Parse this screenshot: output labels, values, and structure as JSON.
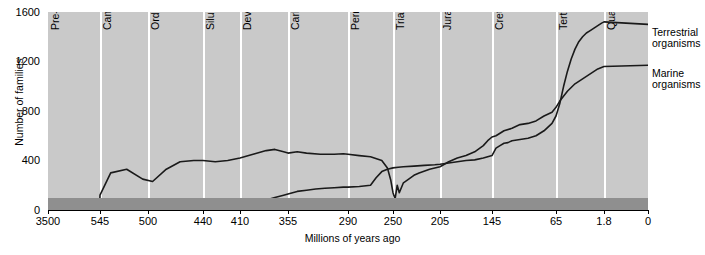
{
  "chart_data": {
    "type": "line",
    "title": "",
    "xlabel": "Millions of years ago",
    "ylabel": "Number of families",
    "ylim": [
      0,
      1600
    ],
    "yticks": [
      0,
      400,
      800,
      1200,
      1600
    ],
    "xlim": [
      3500,
      0
    ],
    "xticks": [
      "3500",
      "545",
      "500",
      "440",
      "410",
      "355",
      "290",
      "250",
      "205",
      "145",
      "65",
      "1.8",
      "0"
    ],
    "grid": false,
    "legend_position": "right-inline",
    "geologic_periods": [
      {
        "label": "Pre-cambrian",
        "start": 3500,
        "end": 545
      },
      {
        "label": "Cambrian",
        "start": 545,
        "end": 500
      },
      {
        "label": "Ordovician",
        "start": 500,
        "end": 440
      },
      {
        "label": "Silurian",
        "start": 440,
        "end": 410
      },
      {
        "label": "Devonian",
        "start": 410,
        "end": 355
      },
      {
        "label": "Carboniferous",
        "start": 355,
        "end": 290
      },
      {
        "label": "Permian",
        "start": 290,
        "end": 250
      },
      {
        "label": "Triassic",
        "start": 250,
        "end": 205
      },
      {
        "label": "Jurassic",
        "start": 205,
        "end": 145
      },
      {
        "label": "Cretaceous",
        "start": 145,
        "end": 65
      },
      {
        "label": "Tertiary",
        "start": 65,
        "end": 1.8
      },
      {
        "label": "Quaternary",
        "start": 1.8,
        "end": 0
      }
    ],
    "series": [
      {
        "name": "Marine organisms",
        "annotation": "Marine\norganisms",
        "points": [
          [
            3500,
            0
          ],
          [
            700,
            0
          ],
          [
            620,
            20
          ],
          [
            560,
            40
          ],
          [
            545,
            120
          ],
          [
            535,
            300
          ],
          [
            520,
            330
          ],
          [
            505,
            250
          ],
          [
            495,
            230
          ],
          [
            480,
            330
          ],
          [
            465,
            390
          ],
          [
            450,
            400
          ],
          [
            440,
            400
          ],
          [
            430,
            390
          ],
          [
            420,
            400
          ],
          [
            410,
            420
          ],
          [
            400,
            440
          ],
          [
            390,
            460
          ],
          [
            380,
            480
          ],
          [
            370,
            490
          ],
          [
            360,
            470
          ],
          [
            355,
            460
          ],
          [
            345,
            470
          ],
          [
            335,
            460
          ],
          [
            320,
            450
          ],
          [
            305,
            450
          ],
          [
            295,
            455
          ],
          [
            290,
            450
          ],
          [
            280,
            440
          ],
          [
            270,
            430
          ],
          [
            260,
            400
          ],
          [
            255,
            340
          ],
          [
            252,
            240
          ],
          [
            250,
            140
          ],
          [
            248,
            90
          ],
          [
            246,
            200
          ],
          [
            244,
            140
          ],
          [
            240,
            220
          ],
          [
            235,
            250
          ],
          [
            230,
            280
          ],
          [
            225,
            300
          ],
          [
            215,
            330
          ],
          [
            205,
            350
          ],
          [
            195,
            390
          ],
          [
            185,
            420
          ],
          [
            175,
            440
          ],
          [
            165,
            470
          ],
          [
            155,
            520
          ],
          [
            150,
            560
          ],
          [
            145,
            590
          ],
          [
            140,
            600
          ],
          [
            130,
            640
          ],
          [
            120,
            660
          ],
          [
            110,
            690
          ],
          [
            100,
            700
          ],
          [
            90,
            720
          ],
          [
            80,
            760
          ],
          [
            70,
            790
          ],
          [
            65,
            830
          ],
          [
            60,
            880
          ],
          [
            50,
            960
          ],
          [
            40,
            1020
          ],
          [
            30,
            1060
          ],
          [
            20,
            1100
          ],
          [
            10,
            1140
          ],
          [
            1.8,
            1160
          ],
          [
            0,
            1170
          ]
        ]
      },
      {
        "name": "Terrestrial organisms",
        "annotation": "Terrestrial\norganisms",
        "points": [
          [
            455,
            0
          ],
          [
            440,
            10
          ],
          [
            430,
            20
          ],
          [
            420,
            30
          ],
          [
            410,
            40
          ],
          [
            400,
            50
          ],
          [
            390,
            60
          ],
          [
            380,
            80
          ],
          [
            370,
            100
          ],
          [
            360,
            120
          ],
          [
            355,
            130
          ],
          [
            345,
            150
          ],
          [
            335,
            160
          ],
          [
            325,
            170
          ],
          [
            315,
            175
          ],
          [
            305,
            180
          ],
          [
            295,
            185
          ],
          [
            290,
            185
          ],
          [
            280,
            190
          ],
          [
            270,
            200
          ],
          [
            265,
            260
          ],
          [
            260,
            310
          ],
          [
            255,
            330
          ],
          [
            250,
            340
          ],
          [
            245,
            345
          ],
          [
            240,
            350
          ],
          [
            230,
            355
          ],
          [
            220,
            360
          ],
          [
            210,
            365
          ],
          [
            205,
            370
          ],
          [
            195,
            380
          ],
          [
            185,
            390
          ],
          [
            175,
            400
          ],
          [
            165,
            405
          ],
          [
            155,
            420
          ],
          [
            150,
            430
          ],
          [
            145,
            440
          ],
          [
            140,
            500
          ],
          [
            135,
            520
          ],
          [
            130,
            540
          ],
          [
            125,
            545
          ],
          [
            120,
            560
          ],
          [
            110,
            570
          ],
          [
            100,
            580
          ],
          [
            90,
            600
          ],
          [
            80,
            640
          ],
          [
            70,
            700
          ],
          [
            65,
            760
          ],
          [
            60,
            860
          ],
          [
            55,
            1000
          ],
          [
            50,
            1120
          ],
          [
            45,
            1220
          ],
          [
            40,
            1300
          ],
          [
            35,
            1360
          ],
          [
            30,
            1400
          ],
          [
            25,
            1430
          ],
          [
            20,
            1450
          ],
          [
            15,
            1470
          ],
          [
            10,
            1490
          ],
          [
            5,
            1510
          ],
          [
            1.8,
            1520
          ],
          [
            0,
            1500
          ]
        ]
      }
    ]
  },
  "annotations": {
    "terrestrial_line1": "Terrestrial",
    "terrestrial_line2": "organisms",
    "marine_line1": "Marine",
    "marine_line2": "organisms"
  }
}
